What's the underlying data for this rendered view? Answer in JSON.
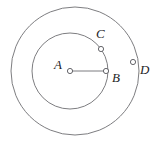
{
  "figure": {
    "background_color": "#ffffff",
    "stroke_color": "#6e6e72",
    "label_color": "#1d1d1f",
    "marker_fill_color": "#ffffff",
    "width": 160,
    "height": 147,
    "circles": [
      {
        "name": "outer-circle",
        "cx": 75,
        "cy": 71,
        "r": 64
      },
      {
        "name": "inner-circle",
        "cx": 70,
        "cy": 71,
        "r": 38
      }
    ],
    "points": [
      {
        "id": "A",
        "label": "A",
        "role": "center",
        "cx": 70,
        "cy": 71,
        "marker_r": 2.6,
        "label_x": 54,
        "label_y": 66
      },
      {
        "id": "B",
        "label": "B",
        "role": "on-inner-circle",
        "cx": 106,
        "cy": 71,
        "marker_r": 2.6,
        "label_x": 112,
        "label_y": 79
      },
      {
        "id": "C",
        "label": "C",
        "role": "on-inner-circle",
        "cx": 101,
        "cy": 49,
        "marker_r": 2.6,
        "label_x": 96,
        "label_y": 35
      },
      {
        "id": "D",
        "label": "D",
        "role": "on-outer-circle",
        "cx": 133,
        "cy": 62,
        "marker_r": 2.6,
        "label_x": 140,
        "label_y": 71
      }
    ],
    "segments": [
      {
        "name": "segment-AB",
        "from": "A",
        "to": "B",
        "x1": 70,
        "y1": 71,
        "x2": 106,
        "y2": 71
      }
    ]
  }
}
